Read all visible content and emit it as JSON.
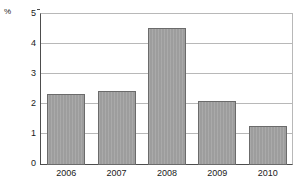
{
  "chart_data": {
    "type": "bar",
    "title": "",
    "xlabel": "",
    "ylabel": "%",
    "categories": [
      "2006",
      "2007",
      "2008",
      "2009",
      "2010"
    ],
    "values": [
      2.35,
      2.45,
      4.5,
      2.1,
      1.3
    ],
    "ylim": [
      0,
      5
    ],
    "yticks": [
      0,
      1,
      2,
      3,
      4,
      5
    ],
    "ytick_labels": [
      "0",
      "1",
      "2",
      "3",
      "4",
      "5"
    ],
    "grid": true,
    "legend": null,
    "series": [
      {
        "name": "",
        "values": [
          2.35,
          2.45,
          4.5,
          2.1,
          1.3
        ]
      }
    ],
    "colors": {
      "bar_fill": "#9d9d9d",
      "bar_border": "#6b6b6b",
      "gridline": "#b8b8b8",
      "axis": "#4d4d4d",
      "text": "#1a1a1a",
      "background": "#ffffff"
    }
  }
}
